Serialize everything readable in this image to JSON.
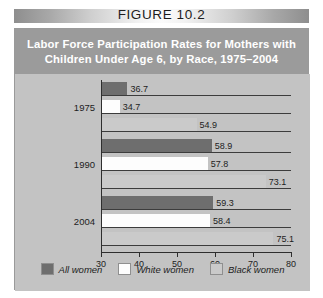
{
  "figure": {
    "header_label": "FIGURE 10.2",
    "title_lines": [
      "Labor Force Participation Rates for Mothers with",
      "Children Under Age 6, by Race, 1975–2004"
    ]
  },
  "colors": {
    "all_women": "#6e6e6e",
    "white_women": "#fdfdfd",
    "black_women": "#cacaca",
    "panel_background": "#c3c3c3",
    "title_band": "#9b9b9b",
    "axis": "#2e2e2e"
  },
  "chart_data": {
    "type": "bar",
    "orientation": "horizontal",
    "title": "Labor Force Participation Rates for Mothers with Children Under Age 6, by Race, 1975–2004",
    "xlabel": "",
    "ylabel": "",
    "categories": [
      "1975",
      "1990",
      "2004"
    ],
    "series": [
      {
        "name": "All women",
        "values": [
          36.7,
          58.9,
          59.3
        ]
      },
      {
        "name": "White women",
        "values": [
          34.7,
          57.8,
          58.4
        ]
      },
      {
        "name": "Black women",
        "values": [
          54.9,
          73.1,
          75.1
        ]
      }
    ],
    "xlim": [
      30,
      80
    ],
    "xticks": [
      30,
      40,
      50,
      60,
      70,
      80
    ],
    "xtick_labels": [
      "30",
      "40",
      "50",
      "60",
      "70",
      "80"
    ],
    "grid": false,
    "legend_position": "bottom",
    "data_labels": [
      "36.7",
      "34.7",
      "54.9",
      "58.9",
      "57.8",
      "73.1",
      "59.3",
      "58.4",
      "75.1"
    ]
  },
  "legend": {
    "items": [
      {
        "label": "All women"
      },
      {
        "label": "White women"
      },
      {
        "label": "Black women"
      }
    ]
  }
}
